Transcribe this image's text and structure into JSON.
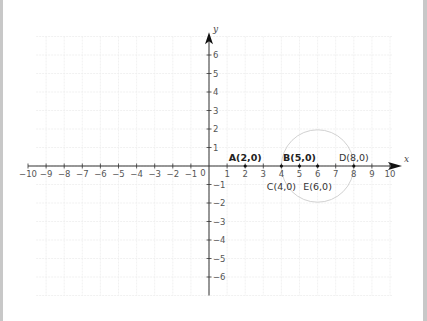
{
  "diagram": {
    "type": "coordinate-plane",
    "axes": {
      "x": {
        "label": "x",
        "min": -10,
        "max": 10,
        "ticks": [
          -10,
          -9,
          -8,
          -7,
          -6,
          -5,
          -4,
          -3,
          -2,
          -1,
          1,
          2,
          3,
          4,
          5,
          6,
          7,
          8,
          9,
          10
        ]
      },
      "y": {
        "label": "y",
        "min": -6,
        "max": 6,
        "ticks": [
          -6,
          -5,
          -4,
          -3,
          -2,
          -1,
          1,
          2,
          3,
          4,
          5,
          6
        ]
      },
      "origin_label": "0"
    },
    "points": [
      {
        "id": "A",
        "label": "A(2,0)",
        "x": 2,
        "y": 0,
        "bold": true,
        "label_pos": "above"
      },
      {
        "id": "B",
        "label": "B(5,0)",
        "x": 5,
        "y": 0,
        "bold": true,
        "label_pos": "above"
      },
      {
        "id": "C",
        "label": "C(4,0)",
        "x": 4,
        "y": 0,
        "bold": false,
        "label_pos": "below"
      },
      {
        "id": "D",
        "label": "D(8,0)",
        "x": 8,
        "y": 0,
        "bold": false,
        "label_pos": "above"
      },
      {
        "id": "E",
        "label": "E(6,0)",
        "x": 6,
        "y": 0,
        "bold": false,
        "label_pos": "below"
      }
    ],
    "circle": {
      "center": [
        6,
        0
      ],
      "radius": 2,
      "stroke": "#cccccc"
    },
    "colors": {
      "axis": "#333333",
      "grid": "#eeeeee",
      "tick_text": "#555555",
      "border": "#c8c8c8"
    }
  }
}
